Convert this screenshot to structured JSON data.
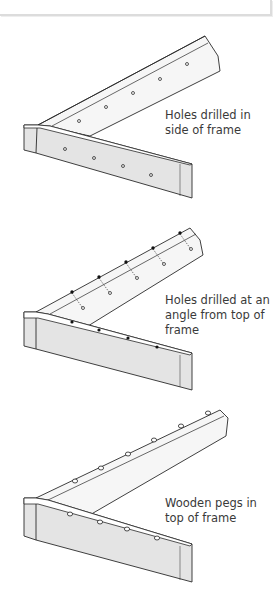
{
  "figure": {
    "panels": [
      {
        "id": "side-holes",
        "caption": "Holes drilled in side of frame",
        "hole_style": "open-circle"
      },
      {
        "id": "angled-holes",
        "caption": "Holes drilled at an angle from top of frame",
        "hole_style": "filled-dot-with-dashed-channel"
      },
      {
        "id": "wooden-pegs",
        "caption": "Wooden pegs in top of frame",
        "hole_style": "peg"
      }
    ],
    "colors": {
      "frame_face": "#e4e4e4",
      "frame_top": "#ffffff",
      "outline": "#2a2a2a",
      "text": "#3a3a3a"
    }
  }
}
